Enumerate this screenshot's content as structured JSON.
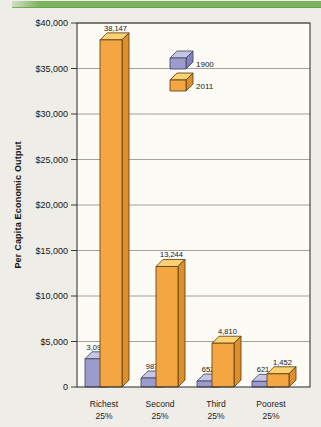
{
  "page": {
    "background_color": "#efede7"
  },
  "header_band": {
    "color": "#7cb35e"
  },
  "chart_data": {
    "type": "bar",
    "title": "",
    "ylabel": "Per Capita Economic Output",
    "xlabel": "",
    "ylim": [
      0,
      40000
    ],
    "y_tick_interval": 5000,
    "grid": true,
    "plot_background": "#fcfbf6",
    "legend": {
      "position": "inside-top",
      "entries": [
        "1900",
        "2011"
      ]
    },
    "y_ticks": [
      {
        "value": 40000,
        "label": "$40,000"
      },
      {
        "value": 35000,
        "label": "$35,000"
      },
      {
        "value": 30000,
        "label": "$30,000"
      },
      {
        "value": 25000,
        "label": "$25,000"
      },
      {
        "value": 20000,
        "label": "$20,000"
      },
      {
        "value": 15000,
        "label": "$15,000"
      },
      {
        "value": 10000,
        "label": "$10,000"
      },
      {
        "value": 5000,
        "label": "$5,000"
      },
      {
        "value": 0,
        "label": "0"
      }
    ],
    "categories": [
      {
        "line1": "Richest",
        "line2": "25%"
      },
      {
        "line1": "Second",
        "line2": "25%"
      },
      {
        "line1": "Third",
        "line2": "25%"
      },
      {
        "line1": "Poorest",
        "line2": "25%"
      }
    ],
    "series": [
      {
        "name": "1900",
        "values": [
          3098,
          987,
          652,
          621
        ],
        "value_labels": [
          "3,098",
          "987",
          "652",
          "621"
        ],
        "colors": {
          "front": "#9c9bce",
          "top": "#c6c5e4",
          "side": "#8281b9",
          "outline": "#3f3f60"
        }
      },
      {
        "name": "2011",
        "values": [
          38147,
          13244,
          4810,
          1452
        ],
        "value_labels": [
          "38,147",
          "13,244",
          "4,810",
          "1,452"
        ],
        "colors": {
          "front": "#f4a642",
          "top": "#fbd172",
          "side": "#de8f2d",
          "outline": "#553a10"
        }
      }
    ]
  }
}
